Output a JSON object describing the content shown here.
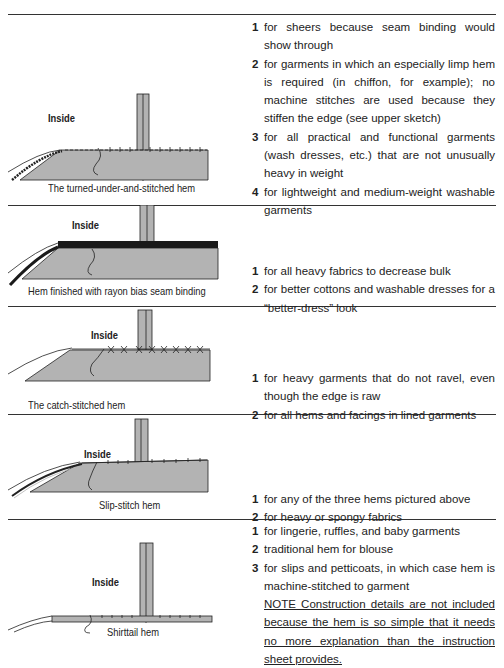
{
  "sections": [
    {
      "figure": {
        "inside_label": "Inside",
        "caption": "The turned-under-and-stitched hem"
      },
      "items": [
        {
          "num": "1",
          "text": "for sheers because seam binding would show through"
        },
        {
          "num": "2",
          "text": "for garments in which an especially limp hem is required (in chiffon, for example); no machine stitches are used because they stiffen the edge (see upper sketch)"
        },
        {
          "num": "3",
          "text": "for all practical and functional garments (wash dresses, etc.) that are not unusually heavy in weight"
        },
        {
          "num": "4",
          "text": "for lightweight and medium-weight washable garments"
        }
      ]
    },
    {
      "figure": {
        "inside_label": "Inside",
        "caption": "Hem finished with rayon bias seam binding"
      },
      "items": [
        {
          "num": "1",
          "text": "for all heavy fabrics to decrease bulk"
        },
        {
          "num": "2",
          "text": "for better cottons and washable dresses for a “better-dress” look"
        }
      ]
    },
    {
      "figure": {
        "inside_label": "Inside",
        "caption": "The catch-stitched hem"
      },
      "items": [
        {
          "num": "1",
          "text": "for heavy garments that do not ravel, even though the edge is raw"
        },
        {
          "num": "2",
          "text": "for all hems and facings in lined garments"
        }
      ]
    },
    {
      "figure": {
        "inside_label": "Inside",
        "caption": "Slip-stitch hem"
      },
      "items": [
        {
          "num": "1",
          "text": "for any of the three hems pictured above"
        },
        {
          "num": "2",
          "text": "for heavy or spongy fabrics"
        }
      ]
    },
    {
      "figure": {
        "inside_label": "Inside",
        "caption": "Shirttail hem"
      },
      "items": [
        {
          "num": "1",
          "text": "for lingerie, ruffles, and baby garments"
        },
        {
          "num": "2",
          "text": "traditional hem for blouse"
        },
        {
          "num": "3",
          "text": "for slips and petticoats, in which case hem is machine-stitched to garment"
        }
      ],
      "note": "NOTE  Construction details are not included because the hem is so simple that it needs no more explanation than the instruction sheet provides."
    }
  ],
  "colors": {
    "fabric": "#b3b3b3",
    "ink": "#222222",
    "binding": "#1a1a1a"
  }
}
